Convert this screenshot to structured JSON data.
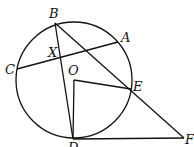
{
  "diagram": {
    "type": "geometry",
    "circle": {
      "center_label": "O",
      "cx": 74,
      "cy": 80,
      "r": 58
    },
    "points": {
      "A": {
        "x": 118,
        "y": 42,
        "label": "A"
      },
      "B": {
        "x": 55,
        "y": 23,
        "label": "B"
      },
      "C": {
        "x": 17,
        "y": 69,
        "label": "C"
      },
      "D": {
        "x": 73,
        "y": 139,
        "label": "D"
      },
      "E": {
        "x": 131,
        "y": 89,
        "label": "E"
      },
      "F": {
        "x": 184,
        "y": 138,
        "label": "F"
      },
      "O": {
        "x": 74,
        "y": 80,
        "label": "O"
      },
      "X": {
        "x": 61,
        "y": 58,
        "label": "X"
      }
    },
    "segments": [
      "CA",
      "BD",
      "BF",
      "OD",
      "OE",
      "DF"
    ]
  }
}
